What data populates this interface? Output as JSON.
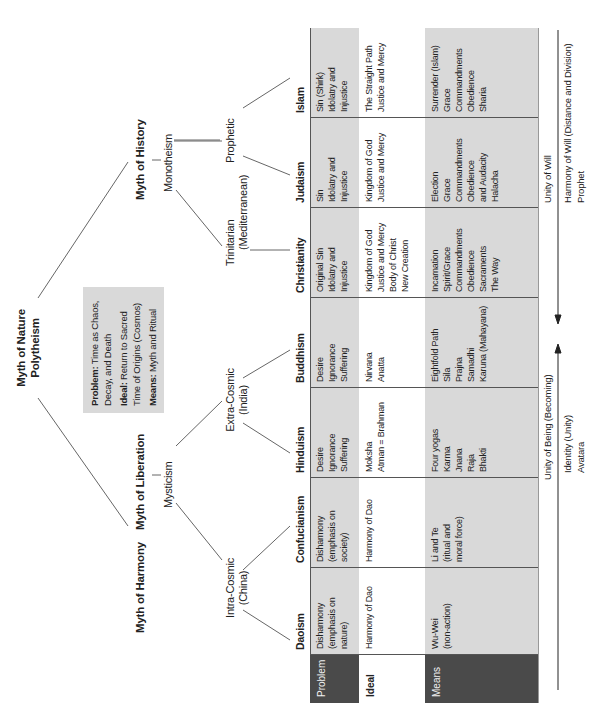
{
  "diagram": {
    "root": {
      "line1": "Myth of Nature",
      "line2": "Polytheism"
    },
    "root_info": {
      "problem_label": "Problem:",
      "problem_text_1": "Time as Chaos,",
      "problem_text_2": "Decay, and Death",
      "ideal_label": "Ideal:",
      "ideal_text_1": "Return to Sacred",
      "ideal_text_2": "Time of Origins (Cosmos)",
      "means_label": "Means:",
      "means_text": "Myth and Ritual"
    },
    "branches": {
      "harmony": "Myth of Harmony",
      "liberation": "Myth of Liberation",
      "mysticism": "Mysticism",
      "history": "Myth of History",
      "monotheism": "Monotheism",
      "intra_cosmic": {
        "line1": "Intra-Cosmic",
        "line2": "(China)"
      },
      "extra_cosmic": {
        "line1": "Extra-Cosmic",
        "line2": "(India)"
      },
      "trinitarian": {
        "line1": "Trinitarian",
        "line2": "(Mediterranean)"
      },
      "prophetic": "Prophetic"
    }
  },
  "table": {
    "row_labels": {
      "problem": "Problem",
      "ideal": "Ideal",
      "means": "Means"
    },
    "columns": [
      {
        "name": "Daoism",
        "problem": [
          "Disharmony",
          "(emphasis on",
          "nature)"
        ],
        "ideal": [
          "Harmony of Dao"
        ],
        "means": [
          "Wu-Wei",
          "(non-action)"
        ]
      },
      {
        "name": "Confucianism",
        "problem": [
          "Disharmony",
          "(emphasis on",
          "society)"
        ],
        "ideal": [
          "Harmony of Dao"
        ],
        "means": [
          "Li and Te",
          "(ritual and",
          "moral force)"
        ]
      },
      {
        "name": "Hinduism",
        "problem": [
          "Desire",
          "Ignorance",
          "Suffering"
        ],
        "ideal": [
          "Moksha",
          "Atman = Brahman"
        ],
        "means": [
          "Four yogas",
          "Karma",
          "Jnana",
          "Raja",
          "Bhakti"
        ]
      },
      {
        "name": "Buddhism",
        "problem": [
          "Desire",
          "Ignorance",
          "Suffering"
        ],
        "ideal": [
          "Nirvana",
          "Anatta"
        ],
        "means": [
          "Eightfold Path",
          "Sila",
          "Prajna",
          "Samadhi",
          "Karuna (Mahayana)"
        ]
      },
      {
        "name": "Christianity",
        "problem": [
          "Original Sin",
          "Idolatry and",
          "Injustice"
        ],
        "ideal": [
          "Kingdom of God",
          "Justice and Mercy",
          "Body of Christ",
          "New Creation"
        ],
        "means": [
          "Incarnation",
          "Spirit/Grace",
          "Commandments",
          "Obedience",
          "Sacraments",
          "The Way"
        ]
      },
      {
        "name": "Judaism",
        "problem": [
          "Sin",
          "Idolatry and",
          "Injustice"
        ],
        "ideal": [
          "Kingdom of God",
          "Justice and Mercy"
        ],
        "means": [
          "Election",
          "Grace",
          "Commandments",
          "Obedience",
          "and Audacity",
          "Halacha"
        ]
      },
      {
        "name": "Islam",
        "problem": [
          "Sin (Shirk)",
          "Idolatry and",
          "Injustice"
        ],
        "ideal": [
          "The Straight Path",
          "Justice and Mercy"
        ],
        "means": [
          "Surrender (Islam)",
          "Grace",
          "Commandments",
          "Obedience",
          "Sharia"
        ]
      }
    ]
  },
  "axes": {
    "being": {
      "label": "Unity of Being (Becoming)",
      "sub1": "Identity (Unity)",
      "sub2": "Avatara"
    },
    "will": {
      "label": "Unity of Will",
      "sub1": "Harmony of Will (Distance and Division)",
      "sub2": "Prophet"
    }
  },
  "colors": {
    "gray_band": "#d9d9d9",
    "dark_label": "#4a4a4a",
    "line": "#555555",
    "text": "#222222"
  }
}
